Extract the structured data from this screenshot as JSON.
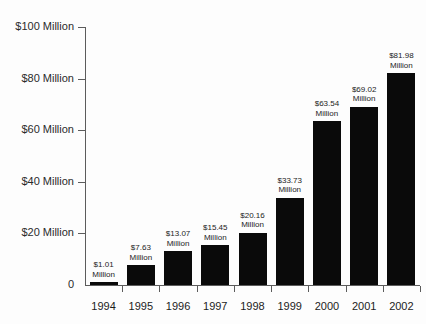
{
  "chart_data": {
    "type": "bar",
    "title": "",
    "xlabel": "",
    "ylabel": "",
    "ylim": [
      0,
      100
    ],
    "grid": false,
    "legend": "none",
    "units": "Million",
    "currency": "$",
    "categories": [
      "1994",
      "1995",
      "1996",
      "1997",
      "1998",
      "1999",
      "2000",
      "2001",
      "2002"
    ],
    "values": [
      1.01,
      7.63,
      13.07,
      15.45,
      20.16,
      33.73,
      63.54,
      69.02,
      81.98
    ],
    "bar_labels": [
      "$1.01\nMillion",
      "$7.63\nMillion",
      "$13.07\nMillion",
      "$15.45\nMillion",
      "$20.16\nMillion",
      "$33.73\nMillion",
      "$63.54\nMillion",
      "$69.02\nMillion",
      "$81.98\nMillion"
    ],
    "y_ticks": [
      0,
      20,
      40,
      60,
      80,
      100
    ],
    "y_tick_labels": [
      "0",
      "$20 Million",
      "$40 Million",
      "$60 Million",
      "$80 Million",
      "$100 Million"
    ],
    "bar_color": "#0a0a0a",
    "axis_color": "#5c5c5c",
    "background_color": "#fdfdfd"
  },
  "bars": [
    {
      "year": "1994",
      "value": 1.01,
      "value_line1": "$1.01",
      "value_line2": "Million"
    },
    {
      "year": "1995",
      "value": 7.63,
      "value_line1": "$7.63",
      "value_line2": "Million"
    },
    {
      "year": "1996",
      "value": 13.07,
      "value_line1": "$13.07",
      "value_line2": "Million"
    },
    {
      "year": "1997",
      "value": 15.45,
      "value_line1": "$15.45",
      "value_line2": "Million"
    },
    {
      "year": "1998",
      "value": 20.16,
      "value_line1": "$20.16",
      "value_line2": "Million"
    },
    {
      "year": "1999",
      "value": 33.73,
      "value_line1": "$33.73",
      "value_line2": "Million"
    },
    {
      "year": "2000",
      "value": 63.54,
      "value_line1": "$63.54",
      "value_line2": "Million"
    },
    {
      "year": "2001",
      "value": 69.02,
      "value_line1": "$69.02",
      "value_line2": "Million"
    },
    {
      "year": "2002",
      "value": 81.98,
      "value_line1": "$81.98",
      "value_line2": "Million"
    }
  ],
  "y_axis": [
    {
      "label": "$100 Million",
      "value": 100
    },
    {
      "label": "$80 Million",
      "value": 80
    },
    {
      "label": "$60 Million",
      "value": 60
    },
    {
      "label": "$40 Million",
      "value": 40
    },
    {
      "label": "$20 Million",
      "value": 20
    },
    {
      "label": "0",
      "value": 0
    }
  ],
  "title": ""
}
